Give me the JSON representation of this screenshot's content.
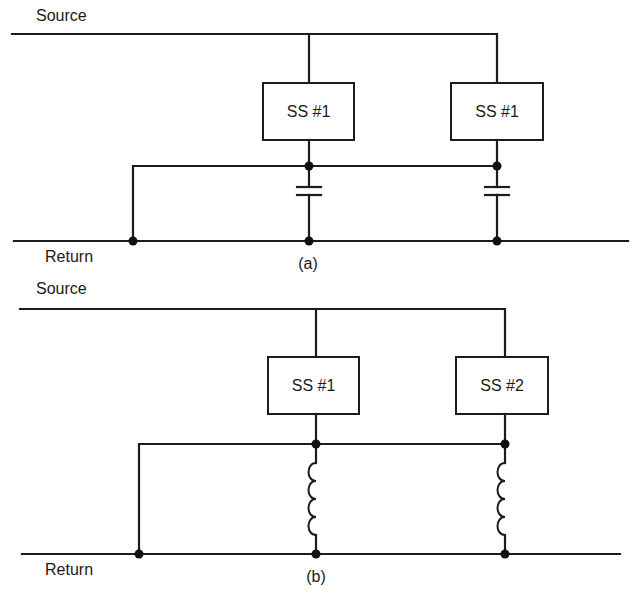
{
  "diagrams": [
    {
      "id": "a",
      "caption": "(a)",
      "source_label": "Source",
      "return_label": "Return",
      "element_type": "capacitor",
      "subsystems": [
        {
          "label": "SS #1"
        },
        {
          "label": "SS #1"
        }
      ]
    },
    {
      "id": "b",
      "caption": "(b)",
      "source_label": "Source",
      "return_label": "Return",
      "element_type": "inductor",
      "subsystems": [
        {
          "label": "SS #1"
        },
        {
          "label": "SS #2"
        }
      ]
    }
  ],
  "colors": {
    "line": "#1c1c1c",
    "background": "#ffffff"
  }
}
